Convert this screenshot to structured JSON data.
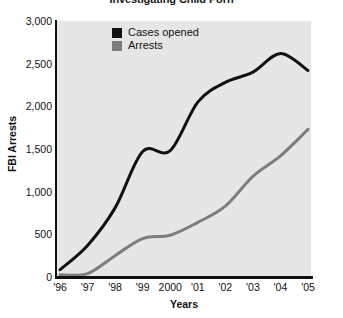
{
  "chart_data": {
    "type": "line",
    "title": "Investigating Child Porn",
    "xlabel": "Years",
    "ylabel": "FBI Arrests",
    "categories": [
      "'96",
      "'97",
      "'98",
      "'99",
      "2000",
      "'01",
      "'02",
      "'03",
      "'04",
      "'05"
    ],
    "ylim": [
      0,
      3000
    ],
    "yticks": [
      "0",
      "500",
      "1,000",
      "1,500",
      "2,000",
      "2,500",
      "3,000"
    ],
    "ytick_values": [
      0,
      500,
      1000,
      1500,
      2000,
      2500,
      3000
    ],
    "grid": false,
    "legend_position": "top-left-inside",
    "series": [
      {
        "name": "Cases opened",
        "color": "#111111",
        "values": [
          85,
          370,
          810,
          1470,
          1480,
          2050,
          2280,
          2400,
          2620,
          2420
        ]
      },
      {
        "name": "Arrests",
        "color": "#7d7d7d",
        "values": [
          25,
          40,
          250,
          450,
          490,
          640,
          830,
          1180,
          1420,
          1730
        ]
      }
    ]
  },
  "colors": {
    "plot_background": "#e6e6e6",
    "page_background": "#ffffff",
    "axis": "#111111",
    "cases_opened": "#111111",
    "arrests": "#7d7d7d"
  }
}
